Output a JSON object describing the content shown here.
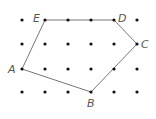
{
  "diagram": {
    "type": "dot-grid-polygon",
    "grid": {
      "columns": 6,
      "rows": 4,
      "x": [
        22,
        45,
        68,
        91,
        114,
        137
      ],
      "y": [
        20,
        44,
        69,
        92
      ],
      "dot_color": "#111111"
    },
    "polygon": {
      "stroke": "#777777",
      "order": [
        "A",
        "B",
        "C",
        "D",
        "E"
      ]
    },
    "vertices": [
      {
        "name": "A",
        "x": 22,
        "y": 69,
        "label_x": 8,
        "label_y": 73
      },
      {
        "name": "B",
        "x": 91,
        "y": 92,
        "label_x": 87,
        "label_y": 107
      },
      {
        "name": "C",
        "x": 137,
        "y": 44,
        "label_x": 141,
        "label_y": 48
      },
      {
        "name": "D",
        "x": 114,
        "y": 20,
        "label_x": 118,
        "label_y": 22
      },
      {
        "name": "E",
        "x": 45,
        "y": 20,
        "label_x": 33,
        "label_y": 22
      }
    ]
  }
}
